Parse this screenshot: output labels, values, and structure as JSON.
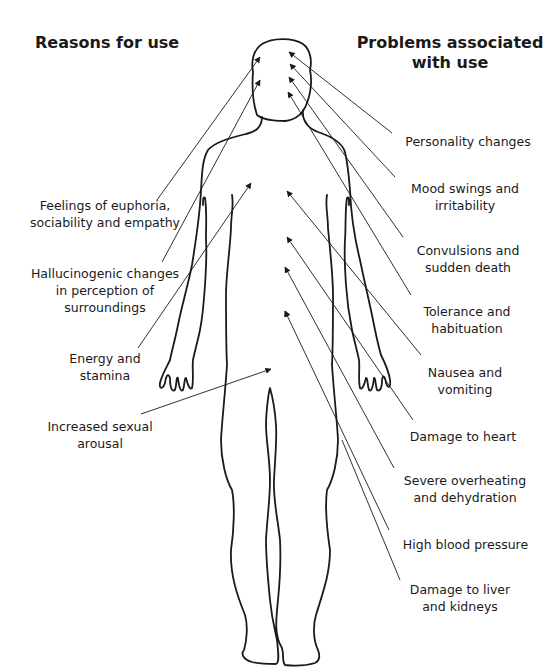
{
  "headings": {
    "left": "Reasons for use",
    "right_line1": "Problems associated",
    "right_line2": "with use"
  },
  "reasons": [
    {
      "line1": "Feelings of euphoria,",
      "line2": "sociability and empathy",
      "line3": ""
    },
    {
      "line1": "Hallucinogenic changes",
      "line2": "in perception of",
      "line3": "surroundings"
    },
    {
      "line1": "Energy and",
      "line2": "stamina",
      "line3": ""
    },
    {
      "line1": "Increased sexual",
      "line2": "arousal",
      "line3": ""
    }
  ],
  "problems": [
    {
      "line1": "Personality changes",
      "line2": ""
    },
    {
      "line1": "Mood swings and",
      "line2": "irritability"
    },
    {
      "line1": "Convulsions and",
      "line2": "sudden death"
    },
    {
      "line1": "Tolerance and",
      "line2": "habituation"
    },
    {
      "line1": "Nausea and",
      "line2": "vomiting"
    },
    {
      "line1": "Damage to heart",
      "line2": ""
    },
    {
      "line1": "Severe overheating",
      "line2": "and dehydration"
    },
    {
      "line1": "High blood pressure",
      "line2": ""
    },
    {
      "line1": "Damage to liver",
      "line2": "and kidneys"
    }
  ],
  "colors": {
    "line": "#1a1a1a",
    "background": "#ffffff"
  }
}
